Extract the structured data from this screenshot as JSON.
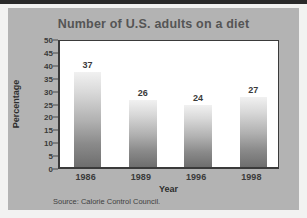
{
  "chart_data": {
    "type": "bar",
    "title": "Number of U.S. adults on a diet",
    "xlabel": "Year",
    "ylabel": "Percentage",
    "categories": [
      "1986",
      "1989",
      "1996",
      "1998"
    ],
    "values": [
      37,
      26,
      24,
      27
    ],
    "ylim": [
      0,
      50
    ],
    "ytick_step": 5,
    "yticks": [
      "50",
      "45",
      "40",
      "35",
      "30",
      "25",
      "20",
      "15",
      "10",
      "5",
      "0"
    ],
    "grid": false,
    "legend": "none",
    "data_labels": [
      "37",
      "26",
      "24",
      "27"
    ],
    "source": "Source: Calorie Control Council.",
    "colors": {
      "panel_background": "#b3b3b3",
      "plot_background": "#ffffff",
      "axis": "#3a3a3a",
      "title_text": "#555555",
      "label_text": "#2e2e2e",
      "bar_gradient_top": "#f1f1f1",
      "bar_gradient_bottom": "#6e6e6e",
      "page_background": "#f2f2f1",
      "top_edge": "#2a2a2a"
    }
  }
}
